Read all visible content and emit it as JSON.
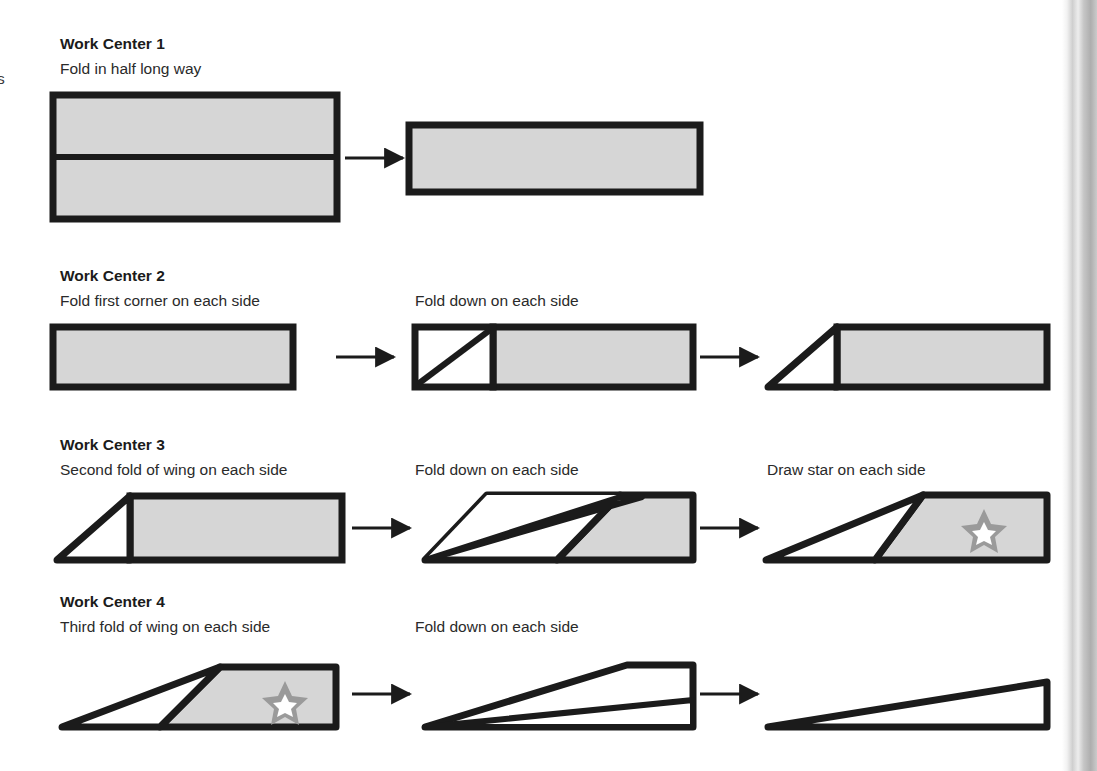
{
  "page": {
    "background_color": "#ffffff",
    "width": 1097,
    "height": 771,
    "left_edge_fragment": "s"
  },
  "colors": {
    "ink": "#1b1b1b",
    "paper_fill": "#d6d6d6",
    "star_fill": "#9a9a9a",
    "star_center": "#ffffff",
    "scan_band": "#b9b9b9",
    "arrow": "#1b1b1b"
  },
  "sections": [
    {
      "id": "work-center-1",
      "title": "Work Center 1",
      "subtitle": "Fold in half long way",
      "steps": [
        {
          "id": "wc1-step1",
          "label": ""
        },
        {
          "id": "wc1-step2",
          "label": ""
        }
      ]
    },
    {
      "id": "work-center-2",
      "title": "Work Center 2",
      "subtitle": "Fold first corner on each side",
      "steps": [
        {
          "id": "wc2-step1",
          "label": ""
        },
        {
          "id": "wc2-step2",
          "label": "Fold down on each side"
        },
        {
          "id": "wc2-step3",
          "label": ""
        }
      ]
    },
    {
      "id": "work-center-3",
      "title": "Work Center 3",
      "subtitle": "Second fold of wing on each side",
      "steps": [
        {
          "id": "wc3-step1",
          "label": ""
        },
        {
          "id": "wc3-step2",
          "label": "Fold down on each side"
        },
        {
          "id": "wc3-step3",
          "label": "Draw star on each side"
        }
      ]
    },
    {
      "id": "work-center-4",
      "title": "Work Center 4",
      "subtitle": "Third fold of wing on each side",
      "steps": [
        {
          "id": "wc4-step1",
          "label": ""
        },
        {
          "id": "wc4-step2",
          "label": "Fold down on each side"
        },
        {
          "id": "wc4-step3",
          "label": ""
        }
      ]
    }
  ],
  "diagram_notes": {
    "shape_legend": "gray fill = paper face, white fill = folded-under face",
    "arrow_count": 9,
    "star_count": 2
  }
}
